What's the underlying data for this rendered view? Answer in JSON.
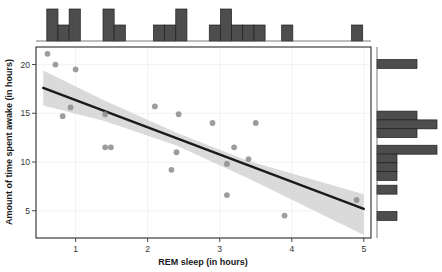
{
  "chart_data": {
    "type": "scatter",
    "title": "",
    "xlabel": "REM sleep (in hours)",
    "ylabel": "Amount of time spent awake (in hours)",
    "xlim": [
      0.45,
      5.1
    ],
    "ylim": [
      2.2,
      21.8
    ],
    "xticks": [
      1,
      2,
      3,
      4,
      5
    ],
    "xtick_labels": [
      "1",
      "2",
      "3",
      "4",
      "5"
    ],
    "yticks": [
      5,
      10,
      15,
      20
    ],
    "ytick_labels": [
      "5",
      "10",
      "15",
      "20"
    ],
    "grid": true,
    "legend": "none",
    "point_color": "#8c8c8c",
    "line_color": "#1a1a1a",
    "band_color": "#d4d4d4",
    "hist_color": "#4d4d4d",
    "points": [
      {
        "x": 0.61,
        "y": 21.1
      },
      {
        "x": 0.72,
        "y": 20.0
      },
      {
        "x": 1.0,
        "y": 19.5
      },
      {
        "x": 0.93,
        "y": 15.6
      },
      {
        "x": 0.82,
        "y": 14.7
      },
      {
        "x": 1.41,
        "y": 14.9
      },
      {
        "x": 1.41,
        "y": 11.5
      },
      {
        "x": 1.49,
        "y": 11.5
      },
      {
        "x": 2.1,
        "y": 15.7
      },
      {
        "x": 2.43,
        "y": 14.9
      },
      {
        "x": 2.4,
        "y": 11.0
      },
      {
        "x": 2.33,
        "y": 9.2
      },
      {
        "x": 2.9,
        "y": 14.0
      },
      {
        "x": 3.5,
        "y": 14.0
      },
      {
        "x": 3.2,
        "y": 11.5
      },
      {
        "x": 3.4,
        "y": 10.3
      },
      {
        "x": 3.1,
        "y": 9.8
      },
      {
        "x": 3.1,
        "y": 6.6
      },
      {
        "x": 3.9,
        "y": 4.5
      },
      {
        "x": 4.9,
        "y": 6.1
      }
    ],
    "regression_line": {
      "x_start": 0.55,
      "y_start": 17.6,
      "x_end": 5.0,
      "y_end": 5.2
    },
    "confidence_band": {
      "upper": [
        [
          0.55,
          19.4
        ],
        [
          1.4,
          16.3
        ],
        [
          2.4,
          13.0
        ],
        [
          3.4,
          10.1
        ],
        [
          5.0,
          6.7
        ]
      ],
      "lower": [
        [
          0.55,
          15.8
        ],
        [
          1.4,
          14.2
        ],
        [
          2.4,
          11.7
        ],
        [
          3.4,
          8.3
        ],
        [
          5.0,
          2.5
        ]
      ]
    },
    "x_histogram": {
      "orientation": "vertical",
      "bin_width": 0.155,
      "bins": [
        {
          "x0": 0.6,
          "count": 2
        },
        {
          "x0": 0.755,
          "count": 1
        },
        {
          "x0": 0.91,
          "count": 2
        },
        {
          "x0": 1.38,
          "count": 2
        },
        {
          "x0": 1.535,
          "count": 1
        },
        {
          "x0": 2.08,
          "count": 1
        },
        {
          "x0": 2.235,
          "count": 1
        },
        {
          "x0": 2.39,
          "count": 2
        },
        {
          "x0": 2.855,
          "count": 1
        },
        {
          "x0": 3.01,
          "count": 2
        },
        {
          "x0": 3.165,
          "count": 1
        },
        {
          "x0": 3.32,
          "count": 1
        },
        {
          "x0": 3.475,
          "count": 1
        },
        {
          "x0": 3.86,
          "count": 1
        },
        {
          "x0": 4.83,
          "count": 1
        }
      ]
    },
    "y_histogram": {
      "orientation": "horizontal",
      "bin_height": 0.92,
      "bins": [
        {
          "y0": 19.6,
          "count": 2
        },
        {
          "y0": 14.3,
          "count": 2
        },
        {
          "y0": 13.4,
          "count": 3
        },
        {
          "y0": 12.5,
          "count": 2
        },
        {
          "y0": 10.8,
          "count": 3
        },
        {
          "y0": 9.9,
          "count": 1
        },
        {
          "y0": 9.0,
          "count": 1
        },
        {
          "y0": 8.1,
          "count": 1
        },
        {
          "y0": 6.7,
          "count": 1
        },
        {
          "y0": 4.0,
          "count": 1
        }
      ]
    }
  }
}
